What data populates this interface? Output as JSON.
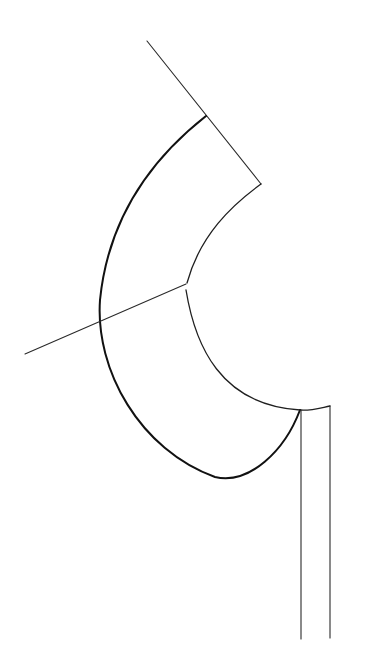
{
  "figure": {
    "type": "line-drawing",
    "background": "#ffffff",
    "stroke_color": "#1a1a1a",
    "width": 384,
    "height": 670
  },
  "elements": {
    "top_guide_line": {
      "from": [
        147,
        41
      ],
      "to": [
        261,
        184
      ]
    },
    "left_guide_line": {
      "from": [
        25,
        354
      ],
      "to": [
        186,
        284
      ]
    },
    "outer_curve": {
      "start": [
        206,
        116
      ],
      "end": [
        300,
        410
      ],
      "lowest_point": [
        225,
        478
      ],
      "leftmost_point": [
        100,
        320
      ]
    },
    "inner_curve_upper": {
      "start": [
        261,
        184
      ],
      "end": [
        187,
        283
      ]
    },
    "inner_curve_lower": {
      "start": [
        186,
        290
      ],
      "end": [
        300,
        410
      ]
    },
    "top_right_edge": {
      "from": [
        300,
        410
      ],
      "to": [
        330,
        406
      ]
    },
    "vertical_line_left": {
      "x": 301,
      "from_y": 410,
      "to_y": 639
    },
    "vertical_line_right": {
      "x": 330,
      "from_y": 406,
      "to_y": 638
    }
  }
}
